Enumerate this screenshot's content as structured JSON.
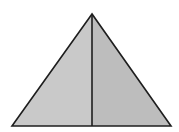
{
  "diagram": {
    "type": "triangle-bisected",
    "background": "#ffffff",
    "stroke_color": "#1e1e1e",
    "stroke_width": 1.6,
    "apex": [
      92,
      14
    ],
    "base_left": [
      12,
      126
    ],
    "base_right": [
      171,
      126
    ],
    "bisector_foot": [
      92,
      126
    ],
    "left_half_fill": "#c9c9c9",
    "right_half_fill": "#bdbdbd"
  }
}
